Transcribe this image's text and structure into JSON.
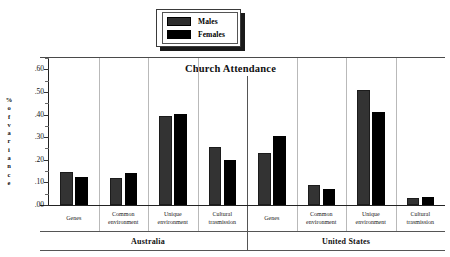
{
  "legend": {
    "items": [
      {
        "label": "Males",
        "color": "#333333",
        "key": "males"
      },
      {
        "label": "Females",
        "color": "#000000",
        "key": "females"
      }
    ]
  },
  "axis": {
    "y_title_chars": [
      "%",
      "o",
      "f",
      "v",
      "a",
      "r",
      "i",
      "a",
      "n",
      "c",
      "e"
    ],
    "y_title": "% of variance",
    "y_ticks": [
      ".00",
      ".10",
      ".20",
      ".30",
      ".40",
      ".50",
      ".60"
    ]
  },
  "chart_data": {
    "type": "bar",
    "title": "Church Attendance",
    "xlabel": "",
    "ylabel": "% of variance",
    "ylim": [
      0.0,
      0.65
    ],
    "ytick_values": [
      0.0,
      0.1,
      0.2,
      0.3,
      0.4,
      0.5,
      0.6
    ],
    "ytick_labels": [
      ".00",
      ".10",
      ".20",
      ".30",
      ".40",
      ".50",
      ".60"
    ],
    "grid": false,
    "legend_position": "top-center",
    "groups": [
      "Australia",
      "United States"
    ],
    "categories": [
      "Genes",
      "Common environment",
      "Unique environment",
      "Cultural trasmission",
      "Genes",
      "Common environment",
      "Unique environment",
      "Cultural trasmission"
    ],
    "category_lines": [
      [
        "Genes"
      ],
      [
        "Common",
        "environment"
      ],
      [
        "Unique",
        "environment"
      ],
      [
        "Cultural",
        "trasmission"
      ],
      [
        "Genes"
      ],
      [
        "Common",
        "environment"
      ],
      [
        "Unique",
        "environment"
      ],
      [
        "Cultural",
        "trasmission"
      ]
    ],
    "series": [
      {
        "name": "Males",
        "color": "#333333",
        "values": [
          0.145,
          0.118,
          0.392,
          0.258,
          0.23,
          0.088,
          0.51,
          0.033
        ]
      },
      {
        "name": "Females",
        "color": "#000000",
        "values": [
          0.122,
          0.14,
          0.403,
          0.2,
          0.307,
          0.07,
          0.413,
          0.034
        ]
      }
    ]
  }
}
